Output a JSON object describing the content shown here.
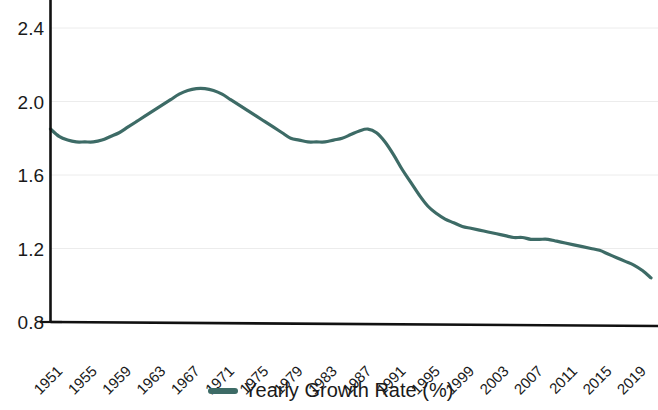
{
  "chart_data": {
    "type": "line",
    "title": "",
    "xlabel": "",
    "ylabel": "",
    "grid": true,
    "legend_position": "bottom",
    "accent_color": "#3d6b66",
    "axis_color": "#111111",
    "grid_color": "#ececec",
    "ylim": [
      0.8,
      2.5
    ],
    "yticks": [
      0.8,
      1.2,
      1.6,
      2.0,
      2.4
    ],
    "ytick_labels": [
      "0.8",
      "1.2",
      "1.6",
      "2.0",
      "2.4"
    ],
    "xlim": [
      1951,
      2021
    ],
    "xtick_labels": [
      "1951",
      "1955",
      "1959",
      "1963",
      "1967",
      "1971",
      "1975",
      "1979",
      "1983",
      "1987",
      "1991",
      "1995",
      "1999",
      "2003",
      "2007",
      "2011",
      "2015",
      "2019"
    ],
    "xticks": [
      1951,
      1955,
      1959,
      1963,
      1967,
      1971,
      1975,
      1979,
      1983,
      1987,
      1991,
      1995,
      1999,
      2003,
      2007,
      2011,
      2015,
      2019
    ],
    "series": [
      {
        "name": "Yearly Growth Rate (%)",
        "color": "#3d6b66",
        "x": [
          1951,
          1952,
          1953,
          1954,
          1955,
          1956,
          1957,
          1958,
          1959,
          1960,
          1961,
          1962,
          1963,
          1964,
          1965,
          1966,
          1967,
          1968,
          1969,
          1970,
          1971,
          1972,
          1973,
          1974,
          1975,
          1976,
          1977,
          1978,
          1979,
          1980,
          1981,
          1982,
          1983,
          1984,
          1985,
          1986,
          1987,
          1988,
          1989,
          1990,
          1991,
          1992,
          1993,
          1994,
          1995,
          1996,
          1997,
          1998,
          1999,
          2000,
          2001,
          2002,
          2003,
          2004,
          2005,
          2006,
          2007,
          2008,
          2009,
          2010,
          2011,
          2012,
          2013,
          2014,
          2015,
          2016,
          2017,
          2018,
          2019,
          2020,
          2021
        ],
        "values": [
          1.85,
          1.81,
          1.79,
          1.78,
          1.78,
          1.78,
          1.79,
          1.81,
          1.83,
          1.86,
          1.89,
          1.92,
          1.95,
          1.98,
          2.01,
          2.04,
          2.06,
          2.07,
          2.07,
          2.06,
          2.04,
          2.01,
          1.98,
          1.95,
          1.92,
          1.89,
          1.86,
          1.83,
          1.8,
          1.79,
          1.78,
          1.78,
          1.78,
          1.79,
          1.8,
          1.82,
          1.84,
          1.85,
          1.83,
          1.78,
          1.71,
          1.63,
          1.56,
          1.49,
          1.43,
          1.39,
          1.36,
          1.34,
          1.32,
          1.31,
          1.3,
          1.29,
          1.28,
          1.27,
          1.26,
          1.26,
          1.25,
          1.25,
          1.25,
          1.24,
          1.23,
          1.22,
          1.21,
          1.2,
          1.19,
          1.17,
          1.15,
          1.13,
          1.11,
          1.08,
          1.04
        ]
      }
    ],
    "legend": [
      {
        "label": "Yearly Growth Rate (%)",
        "color": "#3d6b66",
        "marker": "line"
      }
    ]
  },
  "legend_entry_label": "Yearly Growth Rate (%)"
}
